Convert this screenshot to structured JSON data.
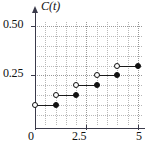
{
  "chart_data": {
    "type": "line",
    "subtype": "step-function",
    "title": "",
    "series_label": "C(t)",
    "xlabel": "",
    "ylabel": "C(t)",
    "xlim": [
      0,
      5.2
    ],
    "ylim": [
      0,
      0.52
    ],
    "grid": true,
    "legend": "none",
    "x_ticks": [
      0,
      2.5,
      5
    ],
    "x_tick_labels": [
      "0",
      "2.5",
      "5"
    ],
    "y_ticks": [
      0.25,
      0.5
    ],
    "y_tick_labels": [
      "0.25",
      "0.50"
    ],
    "x_gridlines": [
      0,
      0.5,
      1,
      1.5,
      2,
      2.5,
      3,
      3.5,
      4,
      4.5,
      5
    ],
    "y_gridlines": [
      0.05,
      0.1,
      0.15,
      0.2,
      0.25,
      0.3,
      0.35,
      0.4,
      0.45,
      0.5
    ],
    "steps": [
      {
        "x_start": 0,
        "x_end": 1,
        "y": 0.1,
        "left_endpoint": "open",
        "right_endpoint": "closed"
      },
      {
        "x_start": 1,
        "x_end": 2,
        "y": 0.15,
        "left_endpoint": "open",
        "right_endpoint": "closed"
      },
      {
        "x_start": 2,
        "x_end": 3,
        "y": 0.2,
        "left_endpoint": "open",
        "right_endpoint": "closed"
      },
      {
        "x_start": 3,
        "x_end": 4,
        "y": 0.25,
        "left_endpoint": "open",
        "right_endpoint": "closed"
      },
      {
        "x_start": 4,
        "x_end": 5,
        "y": 0.3,
        "left_endpoint": "open",
        "right_endpoint": "closed"
      }
    ],
    "colors": {
      "axis": "#3a3a4a",
      "grid": "#b9b9b9",
      "data": "#111111",
      "background": "#ffffff"
    }
  },
  "labels": {
    "y_050": "0.50",
    "y_025": "0.25",
    "x_0": "0",
    "x_25": "2.5",
    "x_5": "5",
    "series": "C(t)"
  }
}
